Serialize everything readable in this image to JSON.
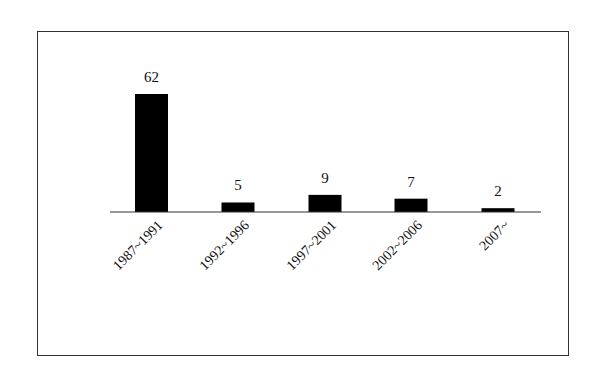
{
  "chart_data": {
    "type": "bar",
    "title": "",
    "xlabel": "",
    "ylabel": "",
    "categories": [
      "1987~1991",
      "1992~1996",
      "1997~2001",
      "2002~2006",
      "2007~"
    ],
    "values": [
      62,
      5,
      9,
      7,
      2
    ],
    "data_labels": [
      "62",
      "5",
      "9",
      "7",
      "2"
    ],
    "bar_color": "#000000",
    "grid": false,
    "legend": null,
    "y_axis_visible": false
  }
}
